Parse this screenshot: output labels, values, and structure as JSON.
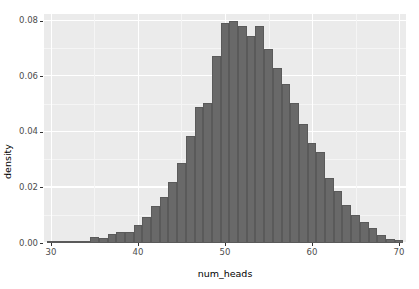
{
  "chart_data": {
    "type": "bar",
    "title": "",
    "subtitle": "",
    "xlabel": "num_heads",
    "ylabel": "density",
    "xlim": [
      29.2,
      70.8
    ],
    "ylim": [
      0.0,
      0.0825
    ],
    "bin_width": 1,
    "grid": true,
    "legend": null,
    "x_ticks": [
      30,
      40,
      50,
      60,
      70
    ],
    "x_tick_labels": [
      "30",
      "40",
      "50",
      "60",
      "70"
    ],
    "y_ticks": [
      0.0,
      0.02,
      0.04,
      0.06,
      0.08
    ],
    "y_tick_labels": [
      "0.00",
      "0.02",
      "0.04",
      "0.06",
      "0.08"
    ],
    "x_minor_ticks": [
      35,
      45,
      55,
      65
    ],
    "y_minor_ticks": [
      0.01,
      0.03,
      0.05,
      0.07
    ],
    "categories": [
      30,
      31,
      32,
      33,
      34,
      35,
      36,
      37,
      38,
      39,
      40,
      41,
      42,
      43,
      44,
      45,
      46,
      47,
      48,
      49,
      50,
      51,
      52,
      53,
      54,
      55,
      56,
      57,
      58,
      59,
      60,
      61,
      62,
      63,
      64,
      65,
      66,
      67,
      68,
      69,
      70
    ],
    "values": [
      0.0,
      0.0,
      0.0002,
      0.0005,
      0.0009,
      0.002,
      0.0018,
      0.0032,
      0.004,
      0.004,
      0.0064,
      0.0093,
      0.0132,
      0.0164,
      0.0219,
      0.029,
      0.0385,
      0.0489,
      0.0505,
      0.0672,
      0.0793,
      0.08,
      0.0781,
      0.0745,
      0.0782,
      0.07,
      0.0631,
      0.0572,
      0.0504,
      0.043,
      0.0362,
      0.0328,
      0.0236,
      0.0187,
      0.0137,
      0.0102,
      0.0077,
      0.0055,
      0.003,
      0.0014,
      0.001
    ],
    "bar_color": "#696969",
    "panel_color": "#ebebeb",
    "grid_color": "#ffffff",
    "tail_note": ""
  },
  "axes": {
    "x_title": "num_heads",
    "y_title": "density"
  }
}
